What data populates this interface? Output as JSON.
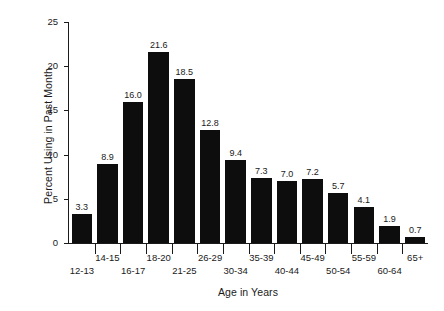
{
  "chart_data": {
    "type": "bar",
    "title": "",
    "xlabel": "Age in Years",
    "ylabel": "Percent Using in Past Month",
    "categories": [
      "12-13",
      "14-15",
      "16-17",
      "18-20",
      "21-25",
      "26-29",
      "30-34",
      "35-39",
      "40-44",
      "45-49",
      "50-54",
      "55-59",
      "60-64",
      "65+"
    ],
    "values": [
      3.3,
      8.9,
      16.0,
      21.6,
      18.5,
      12.8,
      9.4,
      7.3,
      7.0,
      7.2,
      5.7,
      4.1,
      1.9,
      0.7
    ],
    "value_labels": [
      "3.3",
      "8.9",
      "16.0",
      "21.6",
      "18.5",
      "12.8",
      "9.4",
      "7.3",
      "7.0",
      "7.2",
      "5.7",
      "4.1",
      "1.9",
      "0.7"
    ],
    "ylim": [
      0,
      25
    ],
    "yticks": [
      0,
      5,
      10,
      15,
      20,
      25
    ],
    "ytick_labels": [
      "0",
      "5",
      "10",
      "15",
      "20",
      "25"
    ],
    "grid": false,
    "legend": false,
    "bar_color": "#0d0d0d",
    "background_color": "#ffffff",
    "axis_color": "#1a1a1a",
    "label_rows": [
      "bot",
      "top",
      "bot",
      "top",
      "bot",
      "top",
      "bot",
      "top",
      "bot",
      "top",
      "bot",
      "top",
      "bot",
      "top"
    ]
  }
}
